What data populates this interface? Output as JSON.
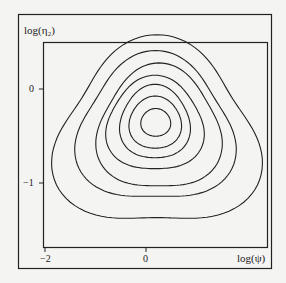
{
  "chart_data": {
    "type": "contour",
    "title": "",
    "xlabel": "log(ψ)",
    "ylabel": "log(η₂)",
    "x_ticks": [
      {
        "value": -2,
        "label": "−2"
      },
      {
        "value": 0,
        "label": "0"
      }
    ],
    "y_ticks": [
      {
        "value": 0,
        "label": "0"
      },
      {
        "value": -1,
        "label": "−1"
      }
    ],
    "xlim": [
      -2.05,
      2.4
    ],
    "ylim": [
      -1.7,
      0.5
    ],
    "grid": false,
    "legend": null,
    "center": {
      "x": 0.18,
      "y": -0.35
    },
    "contours": [
      {
        "level": 1,
        "x_range": [
          -0.12,
          0.48
        ],
        "y_range": [
          -0.51,
          -0.21
        ]
      },
      {
        "level": 2,
        "x_range": [
          -0.36,
          0.7
        ],
        "y_range": [
          -0.65,
          -0.08
        ]
      },
      {
        "level": 3,
        "x_range": [
          -0.55,
          0.88
        ],
        "y_range": [
          -0.77,
          0.04
        ]
      },
      {
        "level": 4,
        "x_range": [
          -0.83,
          1.16
        ],
        "y_range": [
          -0.91,
          0.13
        ]
      },
      {
        "level": 5,
        "x_range": [
          -1.03,
          1.52
        ],
        "y_range": [
          -1.13,
          0.25
        ]
      },
      {
        "level": 6,
        "x_range": [
          -1.45,
          1.8
        ],
        "y_range": [
          -1.28,
          0.37
        ]
      },
      {
        "level": 7,
        "x_range": [
          -1.91,
          2.32
        ],
        "y_range": [
          -1.57,
          0.52
        ]
      }
    ]
  },
  "colors": {
    "line": "#222222",
    "background": "#f4f4f2"
  }
}
